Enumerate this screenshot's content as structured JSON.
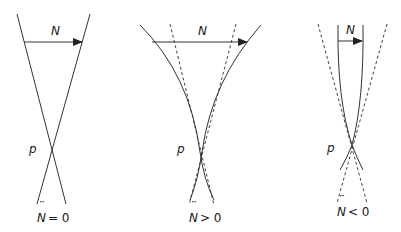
{
  "diagram": {
    "type": "geodesic-congruence-focusing",
    "stroke_color": "#333333",
    "panels": [
      {
        "id": "zero",
        "vector_label": "N",
        "point_label": "p",
        "caption": "N̈ = 0",
        "caption_symbol": "N",
        "caption_relation": "= 0",
        "solid_curves": "straight lines crossing at p",
        "dashed_curves": "none"
      },
      {
        "id": "positive",
        "vector_label": "N",
        "point_label": "p",
        "caption": "N̈ > 0",
        "caption_symbol": "N",
        "caption_relation": "> 0",
        "solid_curves": "curves bending outward (diverging faster) crossing at p",
        "dashed_curves": "straight reference lines"
      },
      {
        "id": "negative",
        "vector_label": "N",
        "point_label": "p",
        "caption": "N̈ < 0",
        "caption_symbol": "N",
        "caption_relation": "< 0",
        "solid_curves": "curves bending inward (converging) crossing at p",
        "dashed_curves": "straight reference lines"
      }
    ]
  }
}
